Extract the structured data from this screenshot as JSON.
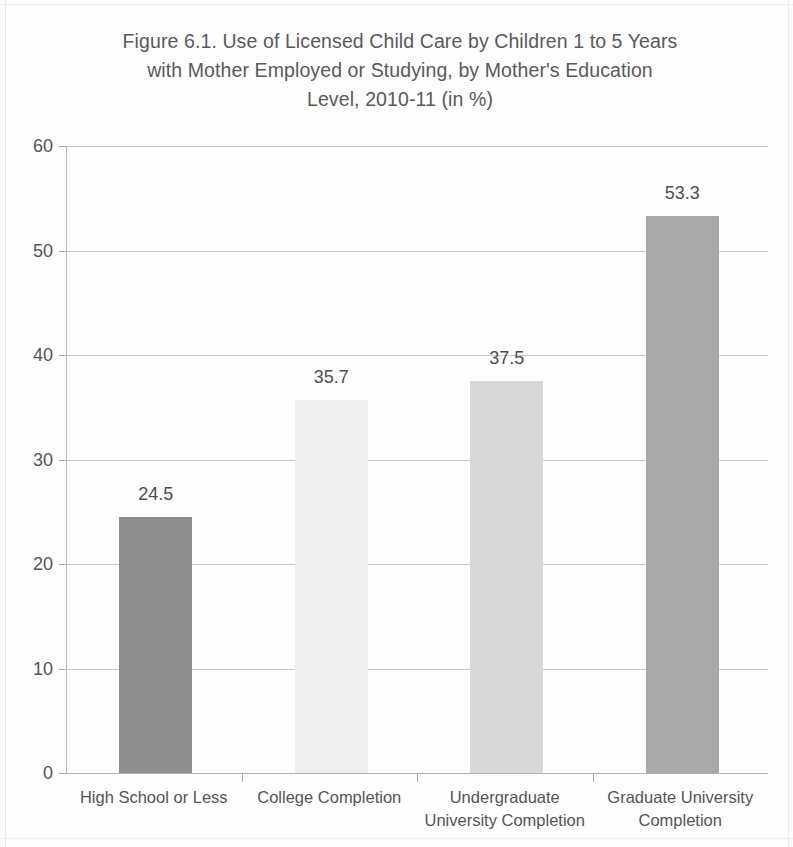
{
  "chart_data": {
    "type": "bar",
    "title": "Figure 6.1.  Use of Licensed Child Care by Children 1 to 5 Years\nwith Mother Employed or Studying, by Mother's Education\nLevel, 2010-11 (in %)",
    "title_lines": [
      "Figure 6.1.  Use of Licensed Child Care by Children 1 to 5 Years",
      "with Mother Employed or Studying, by Mother's Education",
      "Level, 2010-11 (in %)"
    ],
    "categories": [
      "High School or Less",
      "College Completion",
      "Undergraduate University Completion",
      "Graduate University Completion"
    ],
    "category_lines": [
      [
        "High School or Less"
      ],
      [
        "College Completion"
      ],
      [
        "Undergraduate",
        "University Completion"
      ],
      [
        "Graduate University",
        "Completion"
      ]
    ],
    "values": [
      24.5,
      35.7,
      37.5,
      53.3
    ],
    "value_labels": [
      "24.5",
      "35.7",
      "37.5",
      "53.3"
    ],
    "bar_colors": [
      "#8e8e8e",
      "#eeeeee",
      "#d8d8d8",
      "#a9a9a9"
    ],
    "xlabel": "",
    "ylabel": "",
    "ylim": [
      0,
      60
    ],
    "ytick_step": 10,
    "ytick_labels": [
      "0",
      "10",
      "20",
      "30",
      "40",
      "50",
      "60"
    ],
    "ytick_values": [
      0,
      10,
      20,
      30,
      40,
      50,
      60
    ],
    "grid": true,
    "grid_axis": "y",
    "legend": false,
    "units": "%"
  },
  "colors": {
    "gridline": "#c9c9c9",
    "axis": "#b0b0b0",
    "text": "#555555",
    "background": "#fdfdfd"
  }
}
